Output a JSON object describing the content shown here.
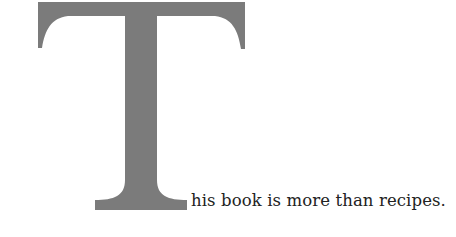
{
  "dropcap": {
    "letter": "T",
    "color": "#7b7b7b"
  },
  "paragraph": {
    "text_after_dropcap": "his book is more than recipes."
  }
}
